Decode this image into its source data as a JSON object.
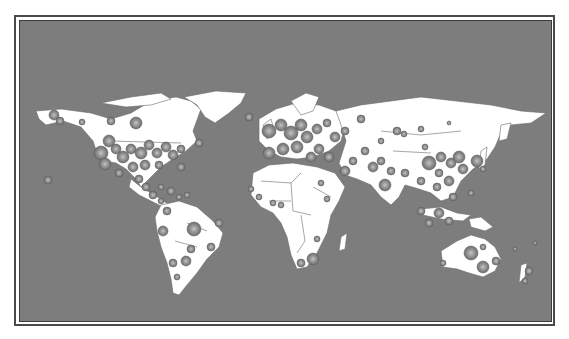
{
  "map": {
    "type": "world-bubble-map",
    "colors": {
      "ocean": "#7d7d7d",
      "land": "#ffffff",
      "border": "#6a6a6a",
      "bubble_fill": "#8a8a8a",
      "bubble_core": "#b5b5b5",
      "bubble_stroke": "#5e5e5e"
    },
    "regions": [
      "North America",
      "South America",
      "Europe",
      "Africa",
      "Asia",
      "Oceania"
    ]
  }
}
